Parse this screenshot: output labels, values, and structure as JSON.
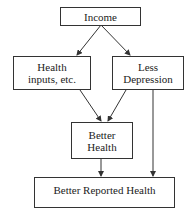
{
  "diagram": {
    "type": "flowchart",
    "nodes": {
      "income": {
        "label": "Income"
      },
      "health_inputs": {
        "label": "Health inputs, etc.",
        "line1": "Health",
        "line2": "inputs, etc."
      },
      "less_depression": {
        "label": "Less Depression",
        "line1": "Less",
        "line2": "Depression"
      },
      "better_health": {
        "label": "Better Health",
        "line1": "Better",
        "line2": "Health"
      },
      "better_reported_health": {
        "label": "Better Reported Health"
      }
    },
    "edges": [
      {
        "from": "Income",
        "to": "Health inputs, etc."
      },
      {
        "from": "Income",
        "to": "Less Depression"
      },
      {
        "from": "Health inputs, etc.",
        "to": "Better Health"
      },
      {
        "from": "Less Depression",
        "to": "Better Health"
      },
      {
        "from": "Better Health",
        "to": "Better Reported Health"
      },
      {
        "from": "Less Depression",
        "to": "Better Reported Health"
      }
    ],
    "colors": {
      "stroke": "#333333",
      "background": "#ffffff",
      "text": "#222222"
    }
  }
}
